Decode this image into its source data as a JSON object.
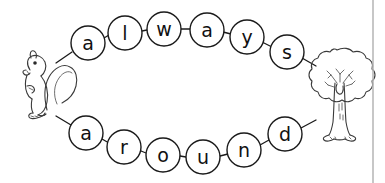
{
  "worksheet": {
    "background_color": "#ffffff",
    "ink_color": "#1a1a1a",
    "art_color": "#3a3a3a",
    "rule_color": "#b9b9b9"
  },
  "words": {
    "top": {
      "word": "always",
      "letters": [
        {
          "char": "a",
          "cx": 88,
          "cy": 43,
          "r": 17
        },
        {
          "char": "l",
          "cx": 125,
          "cy": 33,
          "r": 17
        },
        {
          "char": "w",
          "cx": 164,
          "cy": 29,
          "r": 17
        },
        {
          "char": "a",
          "cx": 207,
          "cy": 30,
          "r": 17
        },
        {
          "char": "y",
          "cx": 247,
          "cy": 37,
          "r": 17
        },
        {
          "char": "s",
          "cx": 287,
          "cy": 52,
          "r": 17
        }
      ]
    },
    "bottom": {
      "word": "around",
      "letters": [
        {
          "char": "a",
          "cx": 86,
          "cy": 133,
          "r": 17
        },
        {
          "char": "r",
          "cx": 124,
          "cy": 147,
          "r": 17
        },
        {
          "char": "o",
          "cx": 163,
          "cy": 155,
          "r": 17
        },
        {
          "char": "u",
          "cx": 203,
          "cy": 157,
          "r": 17
        },
        {
          "char": "n",
          "cx": 244,
          "cy": 150,
          "r": 17
        },
        {
          "char": "d",
          "cx": 285,
          "cy": 134,
          "r": 17
        }
      ]
    }
  },
  "illustrations": [
    {
      "name": "squirrel",
      "label": "squirrel",
      "x": 10,
      "y": 55,
      "width": 65,
      "height": 65
    },
    {
      "name": "tree",
      "label": "tree",
      "x": 305,
      "y": 48,
      "width": 65,
      "height": 92
    }
  ],
  "page_rule": {
    "x": 373,
    "label": "page-edge-line"
  }
}
